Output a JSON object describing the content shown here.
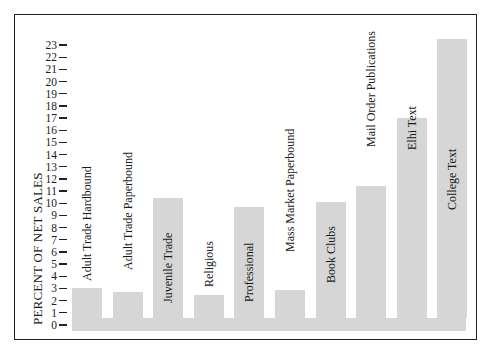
{
  "chart_data": {
    "type": "bar",
    "title": "",
    "xlabel": "",
    "ylabel": "PERCENT OF NET SALES",
    "ylim": [
      0,
      23
    ],
    "yticks": [
      0,
      1,
      2,
      3,
      4,
      5,
      6,
      7,
      8,
      9,
      10,
      11,
      12,
      13,
      14,
      15,
      16,
      17,
      18,
      19,
      20,
      21,
      22,
      23
    ],
    "grid": false,
    "legend": null,
    "categories": [
      "Adult Trade Hardbound",
      "Adult Trade Paperbound",
      "Juvenile Trade",
      "Religious",
      "Professional",
      "Mass Market Paperbound",
      "Book Clubs",
      "Mail Order Publications",
      "Elhi Text",
      "College Text"
    ],
    "values": [
      3.0,
      2.7,
      10.4,
      2.5,
      9.7,
      2.9,
      10.1,
      11.4,
      17.0,
      23.5
    ],
    "color": "#d6d6d6"
  },
  "chart": {
    "ylabel": "PERCENT OF NET SALES",
    "ticks": [
      "0",
      "1",
      "2",
      "3",
      "4",
      "5",
      "6",
      "7",
      "8",
      "9",
      "10",
      "11",
      "12",
      "13",
      "14",
      "15",
      "16",
      "17",
      "18",
      "19",
      "20",
      "21",
      "22",
      "23"
    ],
    "bars": [
      {
        "label": "Adult Trade Hardbound",
        "value": 3.0
      },
      {
        "label": "Adult Trade Paperbound",
        "value": 2.7
      },
      {
        "label": "Juvenile Trade",
        "value": 10.4
      },
      {
        "label": "Religious",
        "value": 2.5
      },
      {
        "label": "Professional",
        "value": 9.7
      },
      {
        "label": "Mass Market Paperbound",
        "value": 2.9
      },
      {
        "label": "Book Clubs",
        "value": 10.1
      },
      {
        "label": "Mail Order Publications",
        "value": 11.4
      },
      {
        "label": "Elhi Text",
        "value": 17.0
      },
      {
        "label": "College Text",
        "value": 23.5
      }
    ]
  }
}
